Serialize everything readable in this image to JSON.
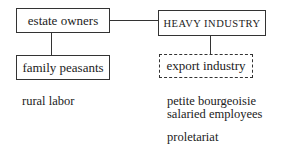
{
  "diagram": {
    "nodes": {
      "estate_owners": "estate owners",
      "heavy_industry": "HEAVY INDUSTRY",
      "family_peasants": "family peasants",
      "export_industry": "export industry"
    },
    "labels": {
      "rural_labor": "rural labor",
      "petite_bourgeoisie": "petite bourgeoisie",
      "salaried_employees": "salaried employees",
      "proletariat": "proletariat"
    }
  }
}
